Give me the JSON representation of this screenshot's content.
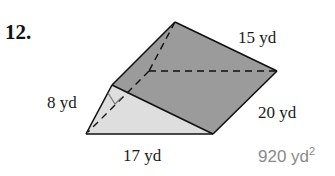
{
  "problem": {
    "number": "12.",
    "shape": "triangular prism",
    "labels": {
      "top_edge": "15 yd",
      "triangle_leg": "8 yd",
      "right_edge": "20 yd",
      "triangle_base": "17 yd"
    },
    "answer": {
      "value": "920 yd",
      "exponent": "2"
    }
  },
  "colors": {
    "rect_face": "#9b9b9b",
    "triangle_face": "#dedede",
    "edge": "#111111",
    "right_angle_mark": "#7a7a7a",
    "answer_text": "#8a8a8a"
  }
}
